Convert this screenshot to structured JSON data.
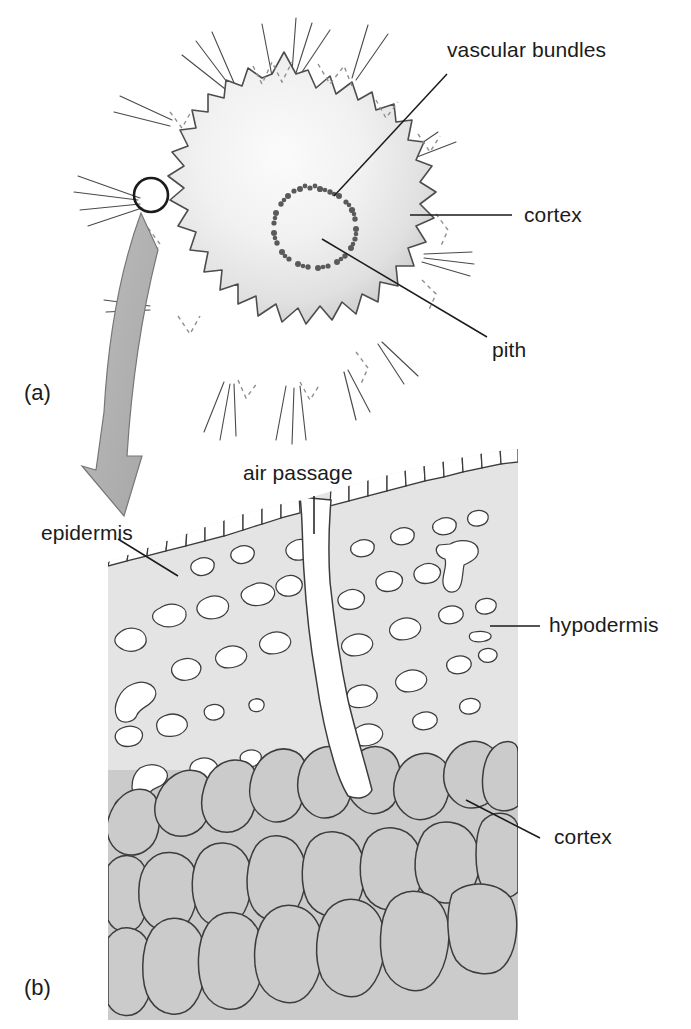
{
  "figure": {
    "panels": [
      {
        "id": "a",
        "label": "(a)",
        "caption": "whole stem transverse section"
      },
      {
        "id": "b",
        "label": "(b)",
        "caption": "enlarged surface region"
      }
    ]
  },
  "panel_a": {
    "label": "(a)",
    "labels": [
      {
        "name": "vascular-bundles",
        "text": "vascular bundles"
      },
      {
        "name": "cortex",
        "text": "cortex"
      },
      {
        "name": "pith",
        "text": "pith"
      }
    ],
    "features": {
      "outline": "lobed / crenulated stem outline with radiating trichome hairs",
      "vascular_ring": "dotted ring of vascular bundles surrounding pith",
      "marker_circle": "small circle marking the enlarged region",
      "arrow": "curved grey arrow linking marker to panel (b)"
    }
  },
  "panel_b": {
    "label": "(b)",
    "labels": [
      {
        "name": "air-passage",
        "text": "air passage"
      },
      {
        "name": "epidermis",
        "text": "epidermis"
      },
      {
        "name": "hypodermis",
        "text": "hypodermis"
      },
      {
        "name": "cortex",
        "text": "cortex"
      }
    ],
    "features": {
      "epidermis": "single outer row of small brick-like cells",
      "hypodermis": "pale grey tissue with white irregular lacunae",
      "cortex": "large polygonal mid-grey parenchyma cells",
      "air_passage": "white channel running inward from the surface"
    }
  },
  "colors": {
    "ink": "#1b1b1b",
    "stroke": "#3a3a3a",
    "arrow_fill": "#b0b0b0",
    "arrow_stroke": "#6d6d6d",
    "hypodermis_fill": "#e2e2e2",
    "cortex_fill": "#cbcbcb",
    "epidermis_fill": "#ffffff",
    "stem_fill_light": "#f2f2f2",
    "stem_fill_edge": "#cfcfcf",
    "background": "#ffffff"
  }
}
